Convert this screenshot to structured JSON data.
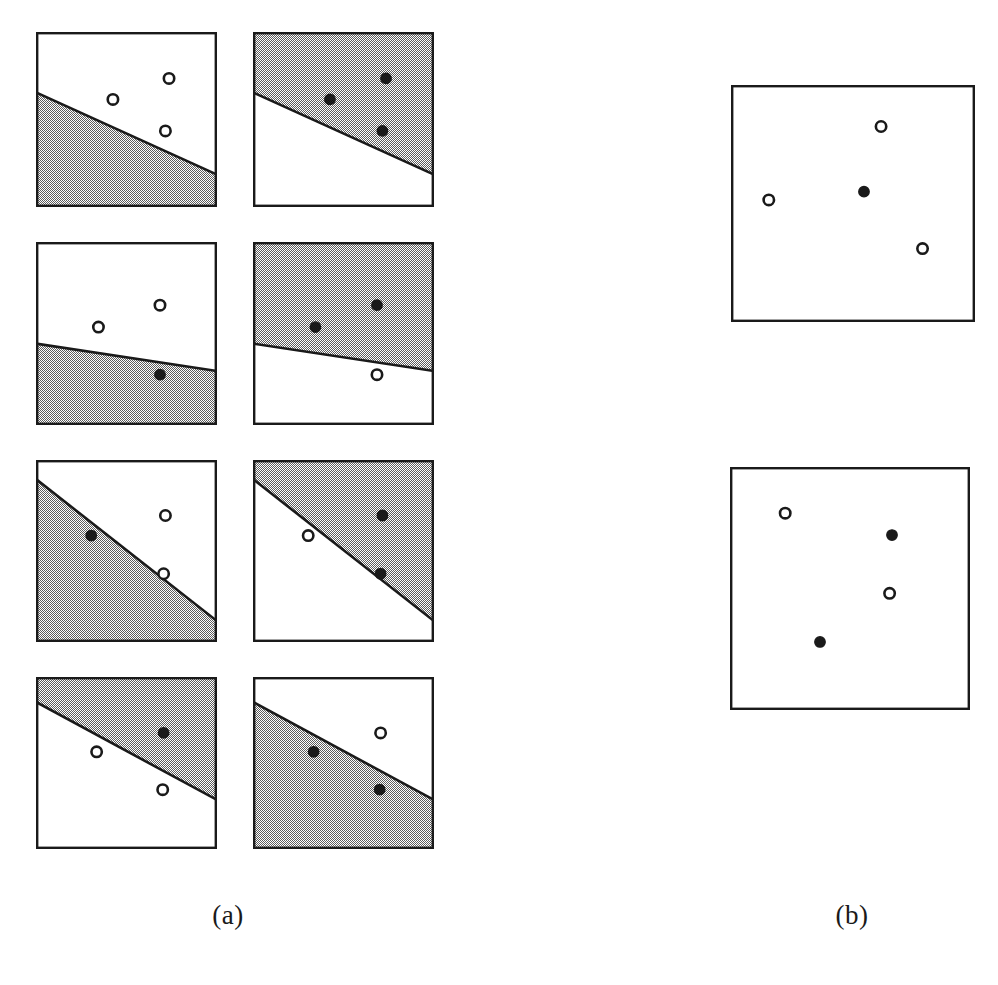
{
  "figure": {
    "background_color": "#ffffff",
    "ink_color": "#1a1a1a",
    "shade_color": "#9a9a9a",
    "border_width": 2.4,
    "line_width": 2.6,
    "open_marker_radius": 5.2,
    "filled_marker_radius": 5.2,
    "captions": [
      {
        "id": "caption-a",
        "label": "(a)"
      },
      {
        "id": "caption-b",
        "label": "(b)"
      }
    ],
    "groups": [
      {
        "name": "group-a",
        "label": "(a)",
        "panels": [
          {
            "name": "panel-a-r1-left",
            "x": 36,
            "y": 32,
            "w": 181,
            "h": 175,
            "line": {
              "x1": 0,
              "y1": 0.345,
              "x2": 1,
              "y2": 0.815
            },
            "shaded_side": "below",
            "points": [
              {
                "x": 0.735,
                "y": 0.265,
                "fill": "open"
              },
              {
                "x": 0.425,
                "y": 0.385,
                "fill": "open"
              },
              {
                "x": 0.715,
                "y": 0.565,
                "fill": "open"
              }
            ]
          },
          {
            "name": "panel-a-r1-right",
            "x": 253,
            "y": 32,
            "w": 181,
            "h": 175,
            "line": {
              "x1": 0,
              "y1": 0.345,
              "x2": 1,
              "y2": 0.815
            },
            "shaded_side": "above",
            "points": [
              {
                "x": 0.735,
                "y": 0.265,
                "fill": "filled"
              },
              {
                "x": 0.425,
                "y": 0.385,
                "fill": "filled"
              },
              {
                "x": 0.715,
                "y": 0.565,
                "fill": "filled"
              }
            ]
          },
          {
            "name": "panel-a-r2-left",
            "x": 36,
            "y": 242,
            "w": 181,
            "h": 183,
            "line": {
              "x1": 0,
              "y1": 0.555,
              "x2": 1,
              "y2": 0.705
            },
            "shaded_side": "below",
            "points": [
              {
                "x": 0.685,
                "y": 0.345,
                "fill": "open"
              },
              {
                "x": 0.345,
                "y": 0.465,
                "fill": "open"
              },
              {
                "x": 0.685,
                "y": 0.725,
                "fill": "filled"
              }
            ]
          },
          {
            "name": "panel-a-r2-right",
            "x": 253,
            "y": 242,
            "w": 181,
            "h": 183,
            "line": {
              "x1": 0,
              "y1": 0.555,
              "x2": 1,
              "y2": 0.705
            },
            "shaded_side": "above",
            "points": [
              {
                "x": 0.685,
                "y": 0.345,
                "fill": "filled"
              },
              {
                "x": 0.345,
                "y": 0.465,
                "fill": "filled"
              },
              {
                "x": 0.685,
                "y": 0.725,
                "fill": "open"
              }
            ]
          },
          {
            "name": "panel-a-r3-left",
            "x": 36,
            "y": 460,
            "w": 181,
            "h": 182,
            "line": {
              "x1": 0,
              "y1": 0.105,
              "x2": 1,
              "y2": 0.885
            },
            "shaded_side": "below",
            "points": [
              {
                "x": 0.715,
                "y": 0.305,
                "fill": "open"
              },
              {
                "x": 0.305,
                "y": 0.415,
                "fill": "filled"
              },
              {
                "x": 0.705,
                "y": 0.625,
                "fill": "open"
              }
            ]
          },
          {
            "name": "panel-a-r3-right",
            "x": 253,
            "y": 460,
            "w": 181,
            "h": 182,
            "line": {
              "x1": 0,
              "y1": 0.105,
              "x2": 1,
              "y2": 0.885
            },
            "shaded_side": "above",
            "points": [
              {
                "x": 0.715,
                "y": 0.305,
                "fill": "filled"
              },
              {
                "x": 0.305,
                "y": 0.415,
                "fill": "open"
              },
              {
                "x": 0.705,
                "y": 0.625,
                "fill": "filled"
              }
            ]
          },
          {
            "name": "panel-a-r4-left",
            "x": 36,
            "y": 677,
            "w": 181,
            "h": 172,
            "line": {
              "x1": 0,
              "y1": 0.145,
              "x2": 1,
              "y2": 0.715
            },
            "shaded_side": "above",
            "points": [
              {
                "x": 0.705,
                "y": 0.325,
                "fill": "filled"
              },
              {
                "x": 0.335,
                "y": 0.435,
                "fill": "open"
              },
              {
                "x": 0.7,
                "y": 0.655,
                "fill": "open"
              }
            ]
          },
          {
            "name": "panel-a-r4-right",
            "x": 253,
            "y": 677,
            "w": 181,
            "h": 172,
            "line": {
              "x1": 0,
              "y1": 0.145,
              "x2": 1,
              "y2": 0.715
            },
            "shaded_side": "below",
            "points": [
              {
                "x": 0.705,
                "y": 0.325,
                "fill": "open"
              },
              {
                "x": 0.335,
                "y": 0.435,
                "fill": "filled"
              },
              {
                "x": 0.7,
                "y": 0.655,
                "fill": "filled"
              }
            ]
          }
        ]
      },
      {
        "name": "group-b",
        "label": "(b)",
        "panels": [
          {
            "name": "panel-b-top",
            "x": 731,
            "y": 85,
            "w": 244,
            "h": 237,
            "line": null,
            "shaded_side": "none",
            "points": [
              {
                "x": 0.615,
                "y": 0.175,
                "fill": "open"
              },
              {
                "x": 0.155,
                "y": 0.485,
                "fill": "open"
              },
              {
                "x": 0.545,
                "y": 0.45,
                "fill": "filled"
              },
              {
                "x": 0.785,
                "y": 0.69,
                "fill": "open"
              }
            ]
          },
          {
            "name": "panel-b-bottom",
            "x": 730,
            "y": 467,
            "w": 240,
            "h": 243,
            "line": null,
            "shaded_side": "none",
            "points": [
              {
                "x": 0.23,
                "y": 0.19,
                "fill": "open"
              },
              {
                "x": 0.675,
                "y": 0.28,
                "fill": "filled"
              },
              {
                "x": 0.665,
                "y": 0.52,
                "fill": "open"
              },
              {
                "x": 0.375,
                "y": 0.72,
                "fill": "filled"
              }
            ]
          }
        ]
      }
    ]
  }
}
